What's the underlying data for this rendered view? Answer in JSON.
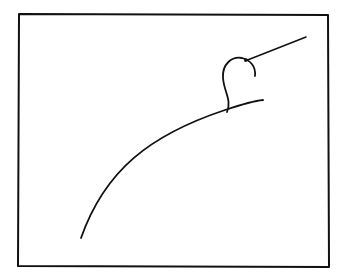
{
  "drawing": {
    "kind": "hand-drawn sketch",
    "background": "#ffffff",
    "stroke_color": "#111111",
    "elements": [
      {
        "name": "frame",
        "shape": "rectangle"
      },
      {
        "name": "arc-surface",
        "shape": "curve"
      },
      {
        "name": "hook-figure",
        "shape": "loop"
      },
      {
        "name": "ray-line",
        "shape": "line"
      }
    ]
  }
}
